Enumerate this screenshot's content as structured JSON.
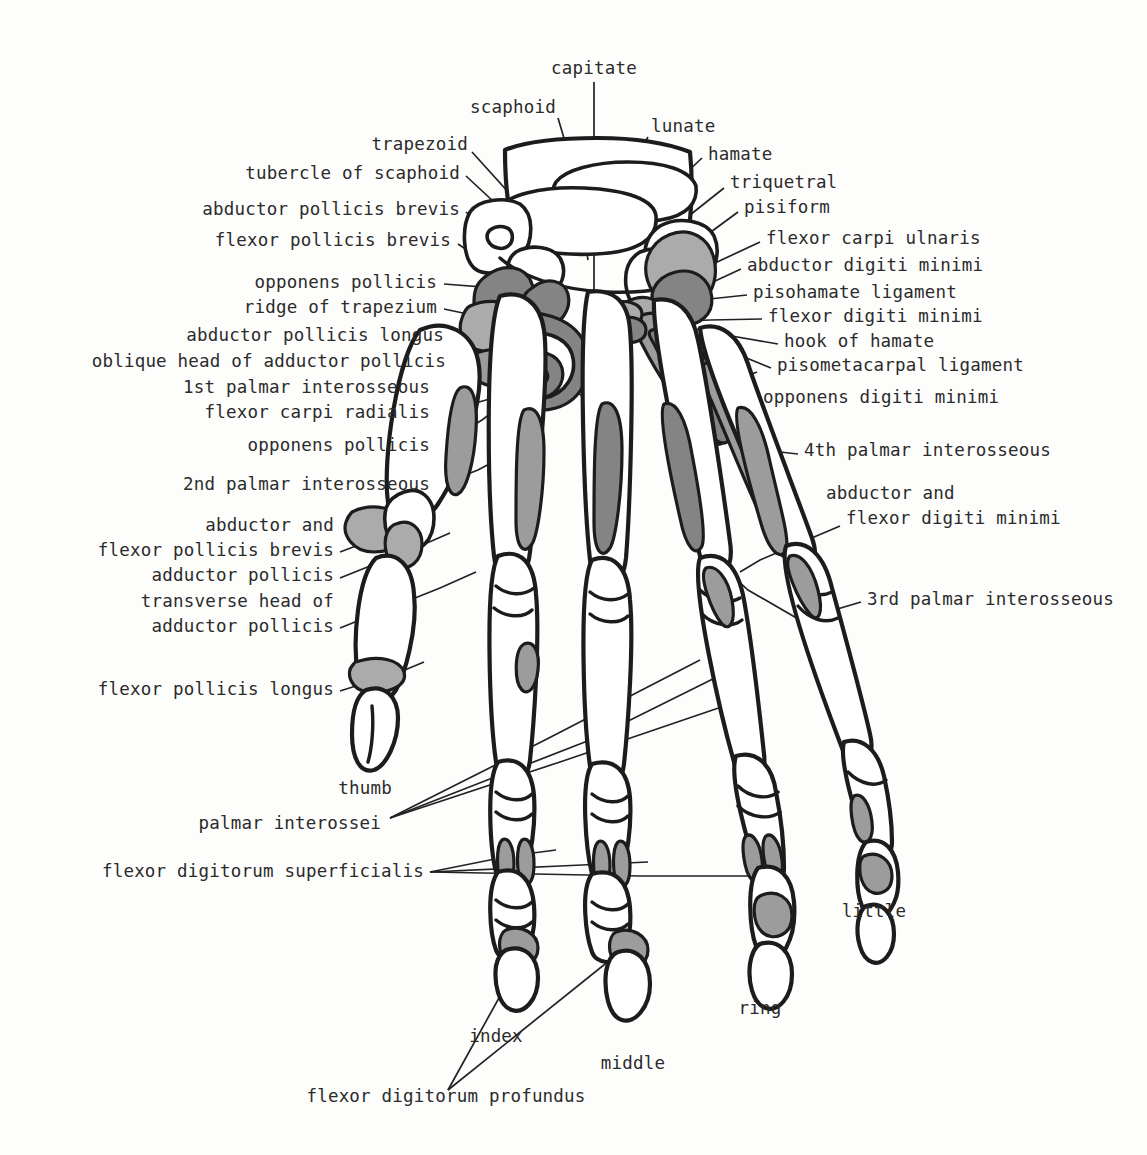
{
  "figure": {
    "view": "palmar (anterior) aspect of right hand skeleton",
    "colors": {
      "background": "#fdfdfc",
      "outline": "#1c1c1c",
      "bone_fill": "#ffffff",
      "muscle_light_gray": "#a9a9a9",
      "muscle_mid_gray": "#9a9a9a",
      "muscle_dark_gray": "#848484",
      "text": "#2b2b2b",
      "leader_line": "#222222"
    }
  },
  "labels": {
    "top": [
      {
        "id": "capitate",
        "text": "capitate",
        "x": 594,
        "y": 69,
        "align": "c"
      },
      {
        "id": "scaphoid",
        "text": "scaphoid",
        "x": 556,
        "y": 108,
        "align": "r"
      },
      {
        "id": "lunate",
        "text": "lunate",
        "x": 651,
        "y": 127,
        "align": "l"
      },
      {
        "id": "trapezoid",
        "text": "trapezoid",
        "x": 468,
        "y": 145,
        "align": "r"
      }
    ],
    "left": [
      {
        "id": "tubercle-of-scaphoid",
        "text": "tubercle of scaphoid",
        "x": 460,
        "y": 174
      },
      {
        "id": "abductor-pollicis-brevis",
        "text": "abductor pollicis brevis",
        "x": 460,
        "y": 210
      },
      {
        "id": "flexor-pollicis-brevis",
        "text": "flexor pollicis brevis",
        "x": 451,
        "y": 241
      },
      {
        "id": "opponens-pollicis-1",
        "text": "opponens pollicis",
        "x": 437,
        "y": 283
      },
      {
        "id": "ridge-of-trapezium",
        "text": "ridge of trapezium",
        "x": 437,
        "y": 308
      },
      {
        "id": "abductor-pollicis-longus",
        "text": "abductor pollicis longus",
        "x": 444,
        "y": 336
      },
      {
        "id": "oblique-head-of-adductor-pollicis",
        "text": "oblique head of adductor pollicis",
        "x": 446,
        "y": 362
      },
      {
        "id": "1st-palmar-interosseous",
        "text": "1st palmar interosseous",
        "x": 430,
        "y": 388
      },
      {
        "id": "flexor-carpi-radialis",
        "text": "flexor carpi radialis",
        "x": 430,
        "y": 413
      },
      {
        "id": "opponens-pollicis-2",
        "text": "opponens pollicis",
        "x": 430,
        "y": 446
      },
      {
        "id": "2nd-palmar-interosseous",
        "text": "2nd palmar interosseous",
        "x": 430,
        "y": 485
      },
      {
        "id": "abductor-and",
        "text": "abductor and",
        "x": 334,
        "y": 526
      },
      {
        "id": "flexor-pollicis-brevis-2",
        "text": "flexor pollicis brevis",
        "x": 334,
        "y": 551
      },
      {
        "id": "adductor-pollicis-1",
        "text": "adductor pollicis",
        "x": 334,
        "y": 576
      },
      {
        "id": "transverse-head-of",
        "text": "transverse head of",
        "x": 334,
        "y": 602
      },
      {
        "id": "adductor-pollicis-2",
        "text": "adductor pollicis",
        "x": 334,
        "y": 627
      },
      {
        "id": "flexor-pollicis-longus",
        "text": "flexor pollicis longus",
        "x": 334,
        "y": 690
      },
      {
        "id": "thumb",
        "text": "thumb",
        "x": 392,
        "y": 789
      },
      {
        "id": "palmar-interossei",
        "text": "palmar interossei",
        "x": 381,
        "y": 824
      },
      {
        "id": "flexor-digitorum-superficialis",
        "text": "flexor digitorum superficialis",
        "x": 424,
        "y": 872
      }
    ],
    "right": [
      {
        "id": "hamate",
        "text": "hamate",
        "x": 708,
        "y": 155
      },
      {
        "id": "triquetral",
        "text": "triquetral",
        "x": 730,
        "y": 183
      },
      {
        "id": "pisiform",
        "text": "pisiform",
        "x": 744,
        "y": 208
      },
      {
        "id": "flexor-carpi-ulnaris",
        "text": "flexor carpi ulnaris",
        "x": 766,
        "y": 239
      },
      {
        "id": "abductor-digiti-minimi",
        "text": "abductor digiti minimi",
        "x": 747,
        "y": 266
      },
      {
        "id": "pisohamate-ligament",
        "text": "pisohamate ligament",
        "x": 753,
        "y": 293
      },
      {
        "id": "flexor-digiti-minimi",
        "text": "flexor digiti minimi",
        "x": 768,
        "y": 317
      },
      {
        "id": "hook-of-hamate",
        "text": "hook of hamate",
        "x": 784,
        "y": 342
      },
      {
        "id": "pisometacarpal-ligament",
        "text": "pisometacarpal ligament",
        "x": 777,
        "y": 366
      },
      {
        "id": "opponens-digiti-minimi",
        "text": "opponens digiti minimi",
        "x": 763,
        "y": 398
      },
      {
        "id": "4th-palmar-interosseous",
        "text": "4th palmar interosseous",
        "x": 804,
        "y": 451
      },
      {
        "id": "abductor-and-2",
        "text": "abductor and",
        "x": 826,
        "y": 494
      },
      {
        "id": "flexor-digiti-minimi-2",
        "text": "flexor digiti minimi",
        "x": 846,
        "y": 519
      },
      {
        "id": "3rd-palmar-interosseous",
        "text": "3rd palmar interosseous",
        "x": 867,
        "y": 600
      }
    ],
    "bottom": [
      {
        "id": "little",
        "text": "little",
        "x": 874,
        "y": 912,
        "align": "c"
      },
      {
        "id": "ring",
        "text": "ring",
        "x": 760,
        "y": 1009,
        "align": "c"
      },
      {
        "id": "index",
        "text": "index",
        "x": 496,
        "y": 1037,
        "align": "c"
      },
      {
        "id": "middle",
        "text": "middle",
        "x": 633,
        "y": 1064,
        "align": "c"
      },
      {
        "id": "flexor-digitorum-profundus",
        "text": "flexor digitorum profundus",
        "x": 446,
        "y": 1097,
        "align": "c"
      }
    ]
  },
  "structures": {
    "carpals": [
      "scaphoid",
      "lunate",
      "capitate",
      "trapezoid",
      "trapezium",
      "hamate",
      "triquetral",
      "pisiform"
    ],
    "digits": [
      "thumb",
      "index",
      "middle",
      "ring",
      "little"
    ],
    "muscles": [
      "abductor pollicis brevis",
      "flexor pollicis brevis",
      "opponens pollicis",
      "abductor pollicis longus",
      "oblique head of adductor pollicis",
      "transverse head of adductor pollicis",
      "flexor carpi radialis",
      "flexor carpi ulnaris",
      "abductor digiti minimi",
      "flexor digiti minimi",
      "opponens digiti minimi",
      "flexor pollicis longus",
      "flexor digitorum superficialis",
      "flexor digitorum profundus",
      "1st palmar interosseous",
      "2nd palmar interosseous",
      "3rd palmar interosseous",
      "4th palmar interosseous"
    ],
    "ligaments": [
      "pisohamate ligament",
      "pisometacarpal ligament",
      "ridge of trapezium",
      "hook of hamate",
      "tubercle of scaphoid"
    ]
  }
}
